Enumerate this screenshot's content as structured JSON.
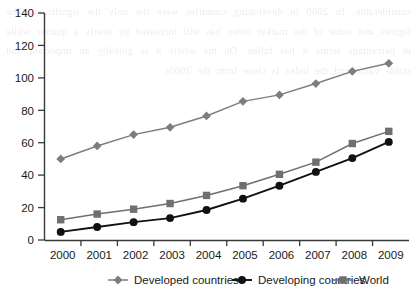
{
  "chart_data": {
    "type": "line",
    "title": "",
    "subtitle": "",
    "xlabel": "",
    "ylabel": "",
    "categories": [
      "2000",
      "2001",
      "2002",
      "2003",
      "2004",
      "2005",
      "2006",
      "2007",
      "2008",
      "2009"
    ],
    "x": [
      2000,
      2001,
      2002,
      2003,
      2004,
      2005,
      2006,
      2007,
      2008,
      2009
    ],
    "ylim": [
      0,
      140
    ],
    "ytick_values": [
      0,
      20,
      40,
      60,
      80,
      100,
      120,
      140
    ],
    "ytick_labels": [
      "0",
      "20",
      "40",
      "60",
      "80",
      "100",
      "120",
      "140"
    ],
    "grid": false,
    "legend_position": "bottom",
    "series": [
      {
        "name": "Developed countries",
        "marker": "diamond",
        "color": "#7d7d7d",
        "values": [
          50,
          58,
          65,
          69.5,
          76.5,
          85.5,
          89.5,
          96.5,
          104,
          109
        ]
      },
      {
        "name": "Developing countries",
        "marker": "circle",
        "color": "#111111",
        "values": [
          5,
          8,
          11,
          13.5,
          18.5,
          25.5,
          33.5,
          42,
          50.5,
          60.5
        ]
      },
      {
        "name": "World",
        "marker": "square",
        "color": "#6f6f6f",
        "values": [
          12.5,
          16,
          19,
          22.5,
          27.5,
          33.5,
          40.5,
          48,
          59.5,
          67
        ]
      }
    ]
  },
  "legend": {
    "items": [
      {
        "label": "Developed countries",
        "marker": "diamond",
        "color": "#7d7d7d"
      },
      {
        "label": "Developing countries",
        "marker": "circle",
        "color": "#111111"
      },
      {
        "label": "World",
        "marker": "square",
        "color": "#6f6f6f"
      }
    ]
  },
  "axes": {
    "y_labels": [
      "140",
      "120",
      "100",
      "80",
      "60",
      "40",
      "20",
      "0"
    ],
    "x_labels": [
      "2000",
      "2001",
      "2002",
      "2003",
      "2004",
      "2005",
      "2006",
      "2007",
      "2008",
      "2009"
    ],
    "axis_color": "#3a3a3a"
  },
  "background_text": "considerable. In 2000 in developing countries were the only the significant. The figures and value of the market index has still increased by nearly a quarter while in percentage terms it has fallen. On the whole it is globally an important and stable value and the index is close from the 2000s"
}
